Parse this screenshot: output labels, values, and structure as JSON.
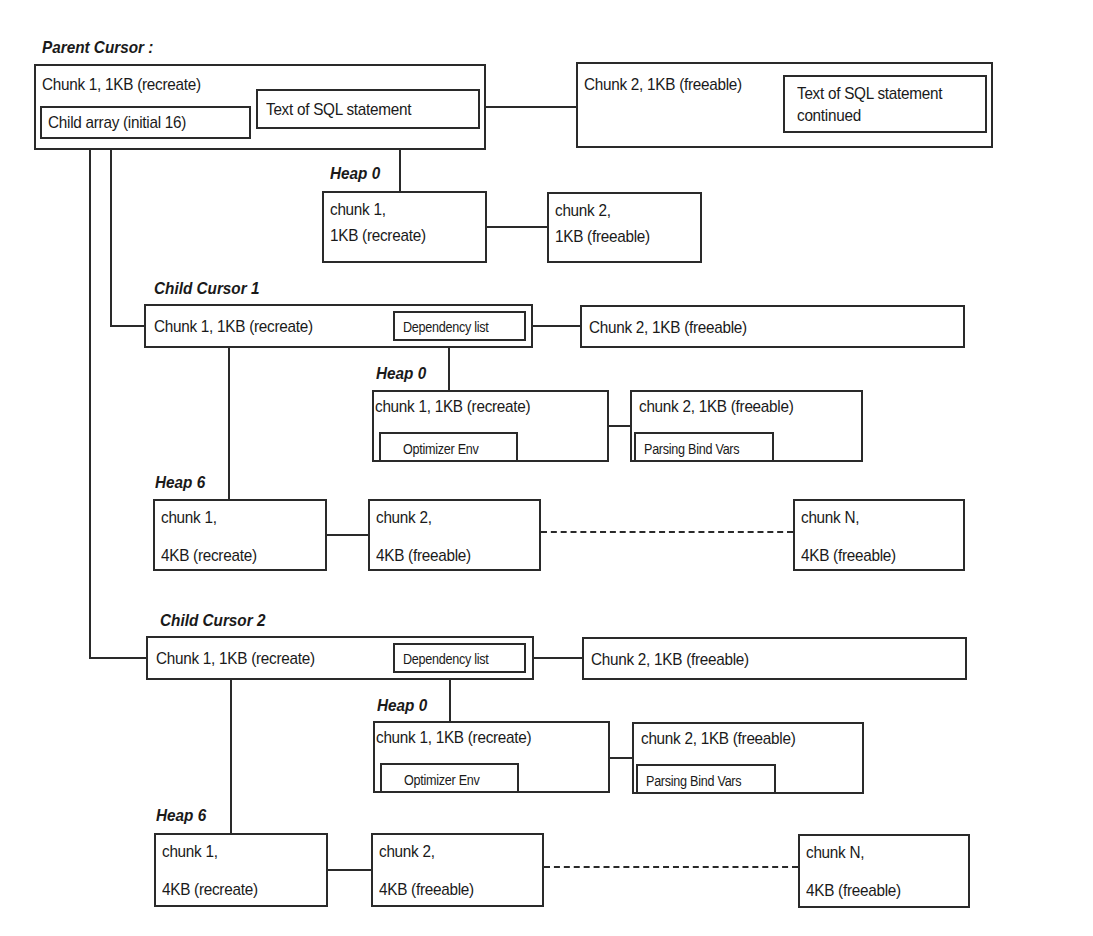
{
  "parent": {
    "label": "Parent Cursor :",
    "chunk1": "Chunk 1, 1KB (recreate)",
    "child_array": "Child array (initial 16)",
    "sql_text": "Text of SQL statement",
    "chunk2": "Chunk 2, 1KB (freeable)",
    "sql_text_cont_1": "Text of SQL statement",
    "sql_text_cont_2": "continued",
    "heap0": {
      "label": "Heap 0",
      "chunk1_l1": "chunk 1,",
      "chunk1_l2": "1KB (recreate)",
      "chunk2_l1": "chunk 2,",
      "chunk2_l2": "1KB (freeable)"
    }
  },
  "children": [
    {
      "label": "Child Cursor 1",
      "chunk1": "Chunk 1, 1KB (recreate)",
      "dependency": "Dependency list",
      "chunk2": "Chunk 2, 1KB (freeable)",
      "heap0": {
        "label": "Heap 0",
        "chunk1": "chunk 1, 1KB (recreate)",
        "optimizer": "Optimizer Env",
        "chunk2": "chunk 2, 1KB (freeable)",
        "bind": "Parsing Bind Vars"
      },
      "heap6": {
        "label": "Heap 6",
        "chunk1_l1": "chunk 1,",
        "chunk1_l2": "4KB (recreate)",
        "chunk2_l1": "chunk 2,",
        "chunk2_l2": "4KB (freeable)",
        "chunkN_l1": "chunk N,",
        "chunkN_l2": "4KB (freeable)"
      }
    },
    {
      "label": "Child Cursor 2",
      "chunk1": "Chunk 1, 1KB (recreate)",
      "dependency": "Dependency list",
      "chunk2": "Chunk 2, 1KB (freeable)",
      "heap0": {
        "label": "Heap 0",
        "chunk1": "chunk 1, 1KB (recreate)",
        "optimizer": "Optimizer Env",
        "chunk2": "chunk 2, 1KB (freeable)",
        "bind": "Parsing Bind Vars"
      },
      "heap6": {
        "label": "Heap 6",
        "chunk1_l1": "chunk 1,",
        "chunk1_l2": "4KB (recreate)",
        "chunk2_l1": "chunk 2,",
        "chunk2_l2": "4KB (freeable)",
        "chunkN_l1": "chunk N,",
        "chunkN_l2": "4KB (freeable)"
      }
    }
  ]
}
